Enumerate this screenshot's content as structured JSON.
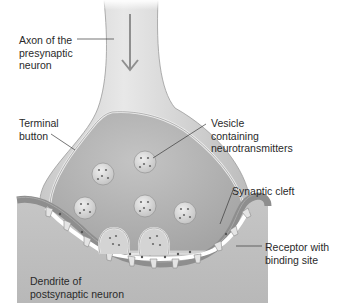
{
  "diagram": {
    "labels": {
      "axon": "Axon of the\npresynaptic\nneuron",
      "terminal": "Terminal\nbutton",
      "vesicle": "Vesicle\ncontaining\nneurotransmitters",
      "cleft": "Synaptic cleft",
      "receptor": "Receptor with\nbinding site",
      "dendrite": "Dendrite of\npostsynaptic neuron"
    },
    "colors": {
      "axon_fill": "#cfcfcf",
      "terminal_fill": "#b4b4b4",
      "terminal_rim": "#e6e6e6",
      "dendrite_fill": "#bdbdbd",
      "membrane": "#7a7a7a",
      "vesicle_fill": "#d9d9d9",
      "text": "#2a2a2a"
    }
  }
}
